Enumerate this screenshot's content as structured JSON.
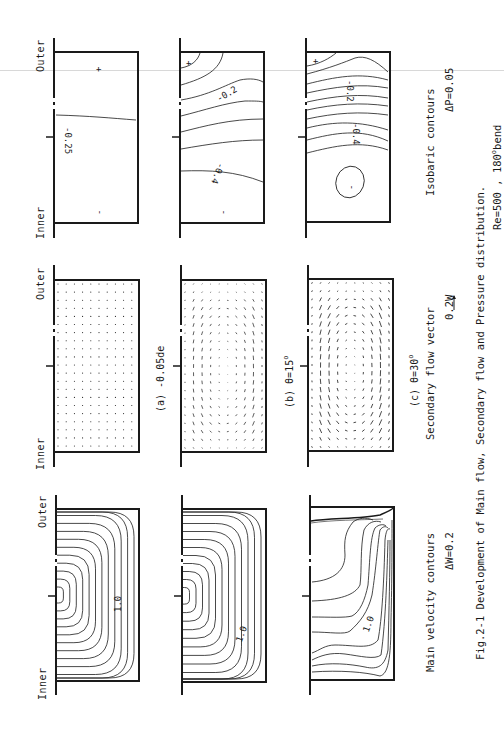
{
  "figure": {
    "caption_line1": "Fig.2-1 Development of Main flow, Secondary flow and Pressure distribution.",
    "caption_line2_prefix": "Re=500 , 180",
    "caption_line2_sup": "o",
    "caption_line2_suffix": "bend"
  },
  "axis_labels": {
    "inner": "Inner",
    "outer": "Outer"
  },
  "rows": {
    "isobaric": {
      "title": "Isobaric contours",
      "interval": "ΔP=0.05",
      "panels": [
        {
          "id": "a",
          "labels": [
            "+",
            "-0.25",
            "-"
          ]
        },
        {
          "id": "b",
          "labels": [
            "+",
            "-0.2",
            "-0.4",
            "-"
          ]
        },
        {
          "id": "c",
          "labels": [
            "+",
            "-0.2",
            "-0.4",
            "-"
          ]
        }
      ]
    },
    "secondary": {
      "title": "Secondary flow vector",
      "scale": "0.2W",
      "panels": [
        {
          "id": "a",
          "label_prefix": "(a) ",
          "label_value": "-0.05de",
          "label_sup": ""
        },
        {
          "id": "b",
          "label_prefix": "(b) ",
          "label_value": "θ=15",
          "label_sup": "o"
        },
        {
          "id": "c",
          "label_prefix": "(c) ",
          "label_value": "θ=30",
          "label_sup": "o"
        }
      ]
    },
    "main_velocity": {
      "title": "Main velocity contours",
      "interval": "ΔW=0.2",
      "panels": [
        {
          "id": "a",
          "labels": [
            "1.0"
          ]
        },
        {
          "id": "b",
          "labels": [
            "1.0"
          ]
        },
        {
          "id": "c",
          "labels": [
            "1.0"
          ]
        }
      ]
    }
  },
  "colors": {
    "ink": "#1a1a1a",
    "paper": "#ffffff"
  }
}
